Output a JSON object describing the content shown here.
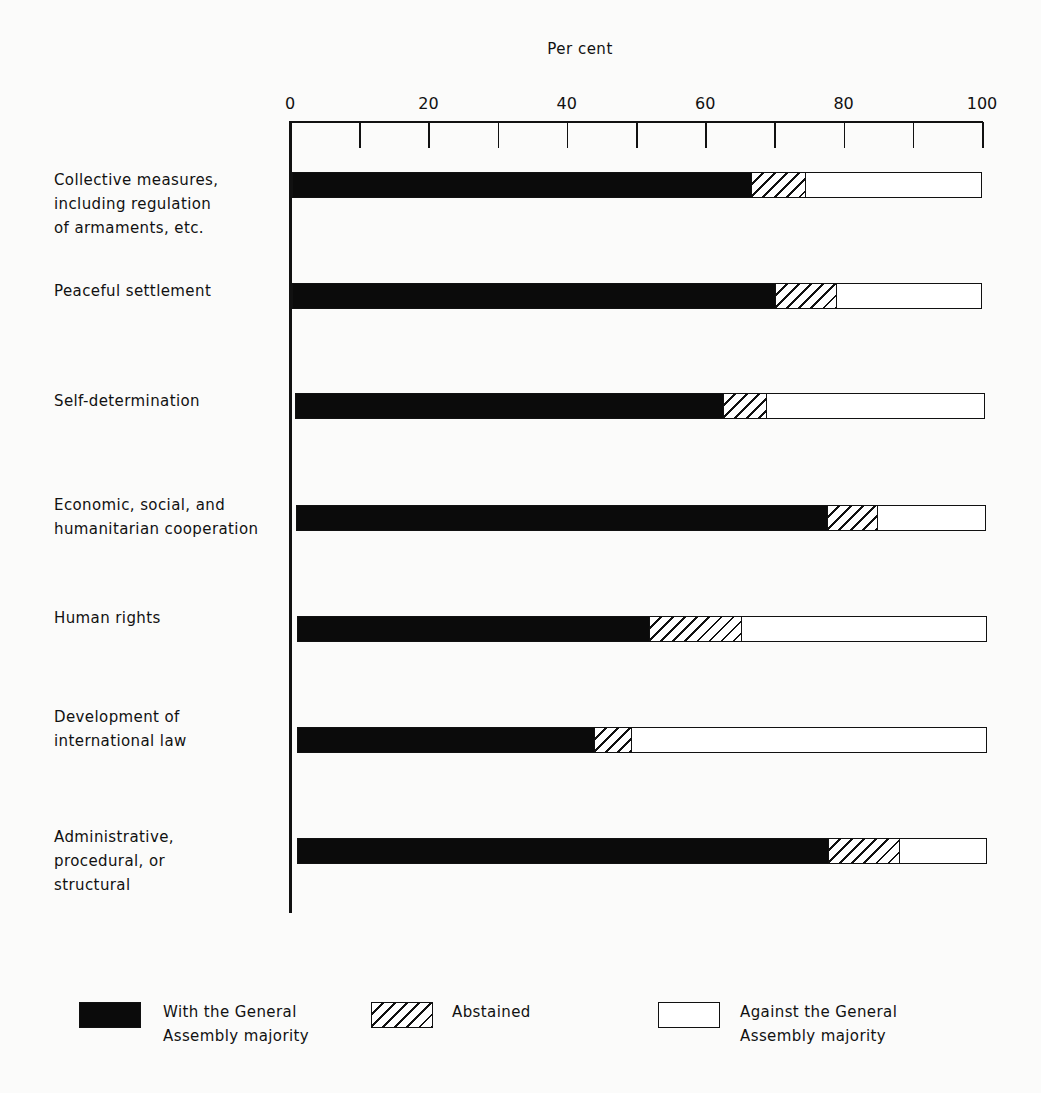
{
  "chart_data": {
    "type": "bar",
    "orientation": "horizontal",
    "stacked": true,
    "title": "Per cent",
    "xlabel": "Per cent",
    "ylabel": "",
    "xlim": [
      0,
      100
    ],
    "x_ticks": [
      0,
      10,
      20,
      30,
      40,
      50,
      60,
      70,
      80,
      90,
      100
    ],
    "x_tick_labels": [
      "0",
      "20",
      "40",
      "60",
      "80",
      "100"
    ],
    "grid": false,
    "legend_position": "bottom",
    "categories": [
      "Collective measures, including regulation of armaments, etc.",
      "Peaceful settlement",
      "Self-determination",
      "Economic, social, and humanitarian cooperation",
      "Human rights",
      "Development of international law",
      "Administrative, procedural, or structural"
    ],
    "series": [
      {
        "name": "With the General Assembly majority",
        "pattern": "solid-black",
        "values": [
          66.5,
          70,
          62,
          77,
          51,
          43,
          77
        ]
      },
      {
        "name": "Abstained",
        "pattern": "hatched",
        "values": [
          8,
          9,
          6.5,
          7.5,
          13.5,
          5.5,
          10.5
        ]
      },
      {
        "name": "Against the General Assembly majority",
        "pattern": "white",
        "values": [
          25.5,
          21,
          31.5,
          15.5,
          35.5,
          51.5,
          12.5
        ]
      }
    ]
  },
  "labels": {
    "title": "Per cent",
    "ticks": [
      "0",
      "20",
      "40",
      "60",
      "80",
      "100"
    ],
    "categories": [
      "Collective measures,\nincluding regulation\nof armaments, etc.",
      "Peaceful settlement",
      "Self-determination",
      "Economic, social, and\nhumanitarian cooperation",
      "Human rights",
      "Development of\ninternational law",
      "Administrative,\nprocedural, or\nstructural"
    ]
  },
  "legend": {
    "with": "With the General\nAssembly majority",
    "abstained": "Abstained",
    "against": "Against the General\nAssembly majority"
  }
}
